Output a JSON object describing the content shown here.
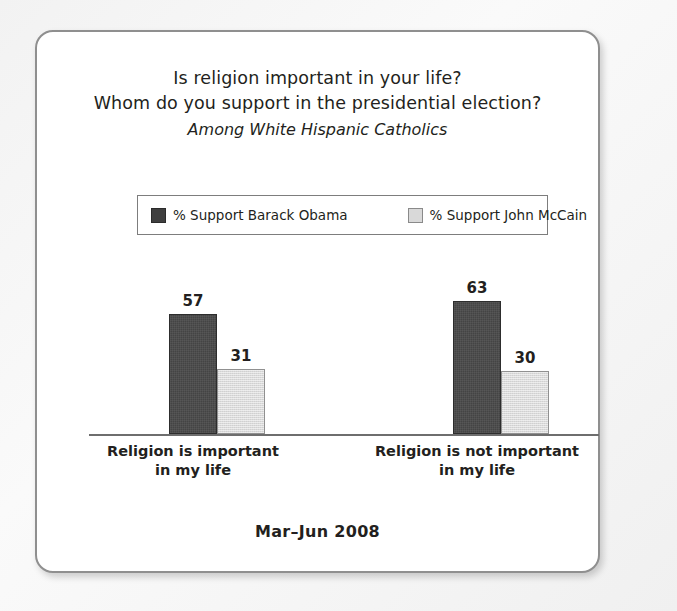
{
  "card": {
    "title_line1": "Is religion important in your life?",
    "title_line2": "Whom do you support in the presidential election?",
    "subtitle": "Among White Hispanic Catholics",
    "footer": "Mar–Jun 2008"
  },
  "legend": {
    "items": [
      {
        "label": "% Support Barack Obama",
        "swatch": "dark-swatch",
        "color": "#444444"
      },
      {
        "label": "% Support John McCain",
        "swatch": "light-swatch",
        "color": "#dadada"
      }
    ]
  },
  "chart_data": {
    "type": "bar",
    "title": "Is religion important in your life? Whom do you support in the presidential election?",
    "subtitle": "Among White Hispanic Catholics",
    "annotation": "Mar–Jun 2008",
    "categories": [
      "Religion is important\nin my life",
      "Religion is not important\nin my life"
    ],
    "category_lines": [
      [
        "Religion is important",
        "in my life"
      ],
      [
        "Religion is not important",
        "in my life"
      ]
    ],
    "series": [
      {
        "name": "% Support Barack Obama",
        "color": "#444444",
        "values": [
          57,
          31
        ]
      },
      {
        "name": "% Support John McCain",
        "color": "#dadada",
        "values": [
          63,
          30
        ]
      }
    ],
    "groups": [
      {
        "category_line1": "Religion is important",
        "category_line2": "in my life",
        "bar_a_value": "57",
        "bar_b_value": "31",
        "bar_a_height": 120,
        "bar_b_height": 65
      },
      {
        "category_line1": "Religion is not important",
        "category_line2": "in my life",
        "bar_a_value": "63",
        "bar_b_value": "30",
        "bar_b_height": 63,
        "bar_a_height": 133
      }
    ],
    "xlabel": "",
    "ylabel": "",
    "ylim": [
      0,
      100
    ],
    "grid": false,
    "legend_position": "top"
  }
}
